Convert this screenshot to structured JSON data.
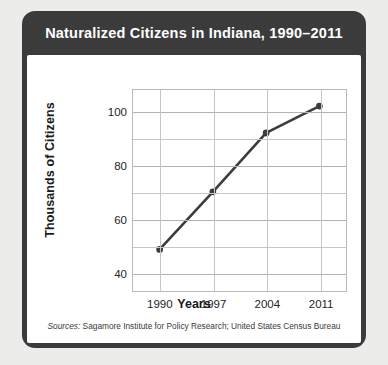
{
  "card": {
    "title": "Naturalized Citizens in Indiana, 1990–2011",
    "title_bar_color": "#3b3b3b",
    "title_text_color": "#ffffff",
    "panel_color": "#ffffff",
    "page_background": "#ececeb"
  },
  "sources": {
    "prefix": "Sources:",
    "text": " Sagamore Institute for Policy Research; United States Census Bureau"
  },
  "chart_data": {
    "type": "line",
    "title": "Naturalized Citizens in Indiana, 1990–2011",
    "xlabel": "Years",
    "ylabel": "Thousands of Citizens",
    "x": [
      1990,
      1997,
      2004,
      2011
    ],
    "values": [
      48.5,
      70,
      92,
      102
    ],
    "categories": [
      "1990",
      "1997",
      "2004",
      "2011"
    ],
    "xtick_labels": [
      "1990",
      "1997",
      "2004",
      "2011"
    ],
    "ytick_labels": [
      "40",
      "60",
      "80",
      "100"
    ],
    "ytick_values": [
      40,
      60,
      80,
      100
    ],
    "yminor_values": [
      50,
      70,
      90
    ],
    "xlim": [
      1986.5,
      2014.5
    ],
    "ylim": [
      33,
      108
    ],
    "grid": true,
    "legend": false,
    "line_color": "#3c3c3c",
    "marker_color": "#3c3c3c",
    "marker": "circle",
    "series": [
      {
        "name": "Naturalized Citizens",
        "points": [
          {
            "x": 1990,
            "y": 48.5
          },
          {
            "x": 1997,
            "y": 70
          },
          {
            "x": 2004,
            "y": 92
          },
          {
            "x": 2011,
            "y": 102
          }
        ]
      }
    ]
  }
}
